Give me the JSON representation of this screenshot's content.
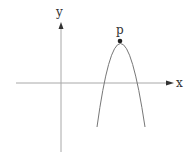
{
  "diagram": {
    "type": "parabola-plot",
    "axes": {
      "x_label": "x",
      "y_label": "y",
      "color": "#999999",
      "arrow_color": "#333333"
    },
    "curve": {
      "shape": "downward parabola",
      "color": "#666666"
    },
    "vertex": {
      "label": "p",
      "color": "#222222"
    }
  }
}
